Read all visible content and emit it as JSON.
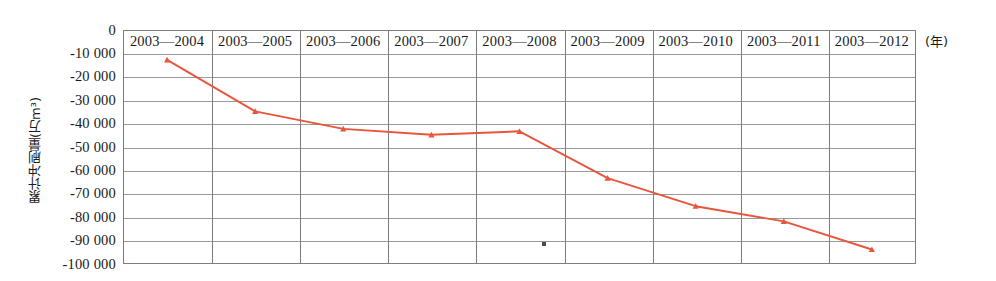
{
  "chart_data": {
    "type": "line",
    "title": "",
    "xlabel": "(年)",
    "ylabel": "累计冲刷量(万m³)",
    "categories": [
      "2003—2004",
      "2003—2005",
      "2003—2006",
      "2003—2007",
      "2003—2008",
      "2003—2009",
      "2003—2010",
      "2003—2011",
      "2003—2012"
    ],
    "values": [
      -13000,
      -35000,
      -42500,
      -45000,
      -43500,
      -63500,
      -75500,
      -82000,
      -94000
    ],
    "series": [
      {
        "name": "累计冲刷量",
        "values": [
          -13000,
          -35000,
          -42500,
          -45000,
          -43500,
          -63500,
          -75500,
          -82000,
          -94000
        ]
      }
    ],
    "ylim": [
      -100000,
      0
    ],
    "ytick_labels": [
      "0",
      "-10 000",
      "-20 000",
      "-30 000",
      "-40 000",
      "-50 000",
      "-60 000",
      "-70 000",
      "-80 000",
      "-90 000",
      "-100 000"
    ],
    "ytick_values": [
      0,
      -10000,
      -20000,
      -30000,
      -40000,
      -50000,
      -60000,
      -70000,
      -80000,
      -90000,
      -100000
    ],
    "grid": true,
    "legend": "none",
    "series_color": "#E8553C",
    "grid_color": "#9a9a9a",
    "frame_color": "#7d7d7d",
    "marker": "triangle",
    "annotations": []
  }
}
